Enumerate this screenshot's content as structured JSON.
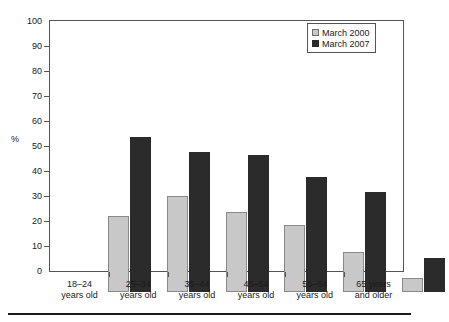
{
  "chart_data": {
    "type": "bar",
    "title": "",
    "subtitle": "",
    "xlabel": "",
    "ylabel": "%",
    "ylim": [
      0,
      100
    ],
    "ytick_step": 10,
    "yticks": [
      0,
      10,
      20,
      30,
      40,
      50,
      60,
      70,
      80,
      90,
      100
    ],
    "ytick_labels": [
      "0",
      "10",
      "20",
      "30",
      "40",
      "50",
      "60",
      "70",
      "80",
      "90",
      "100"
    ],
    "grid": false,
    "legend_position": "top-right",
    "categories": [
      "18–24 years old",
      "25–34 years old",
      "35–44 years old",
      "45–54 years old",
      "55–64 years old",
      "65 years and older"
    ],
    "category_lines": [
      [
        "18–24",
        "years old"
      ],
      [
        "25–34",
        "years old"
      ],
      [
        "35–44",
        "years old"
      ],
      [
        "45–54",
        "years old"
      ],
      [
        "55–64",
        "years old"
      ],
      [
        "65 years",
        "and older"
      ]
    ],
    "series": [
      {
        "name": "March 2000",
        "color": "#c8c8c8",
        "values": [
          30.5,
          38.5,
          32,
          27,
          16,
          5.5
        ]
      },
      {
        "name": "March 2007",
        "color": "#2b2b2b",
        "values": [
          62,
          56,
          55,
          46,
          40,
          13.5
        ]
      }
    ]
  },
  "legend": {
    "items": [
      {
        "label": "March 2000"
      },
      {
        "label": "March 2007"
      }
    ]
  },
  "colors": {
    "series_2000": "#c8c8c8",
    "series_2007": "#2b2b2b",
    "axis": "#555555",
    "text": "#1a1a1a",
    "background": "#ffffff"
  }
}
